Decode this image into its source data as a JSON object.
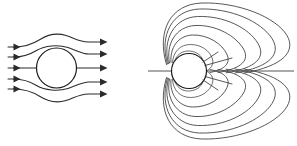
{
  "figure": {
    "background_color": "#ffffff",
    "width": 297,
    "height": 146,
    "panels": [
      {
        "id": "left-panel",
        "name": "streamline-flow-diagram",
        "description": "Uniform flow deflected around a circular body, five streamlines with arrowheads at both ends",
        "line_color": "#2b2b2b",
        "body": {
          "shape": "circle",
          "cx": 56.5,
          "cy": 68,
          "r": 20
        },
        "streamline_count": 5,
        "arrow_count_left": 5,
        "arrow_count_right": 5,
        "flow_direction": "left-to-right",
        "streamlines": [
          {
            "y_inlet": 47,
            "y_outlet": 42,
            "offset": -2
          },
          {
            "y_inlet": 57,
            "y_outlet": 54,
            "offset": -1
          },
          {
            "y_inlet": 68,
            "y_outlet": 68,
            "offset": 0
          },
          {
            "y_inlet": 79,
            "y_outlet": 82,
            "offset": 1
          },
          {
            "y_inlet": 89,
            "y_outlet": 94,
            "offset": 2
          }
        ],
        "inlet_x": 12,
        "outlet_x": 104
      },
      {
        "id": "right-panel",
        "name": "dipole-field-diagram",
        "description": "Magnetic dipole field with nested closed loops above and below, stretched toward the right, horizontal neutral line through the centre",
        "line_color": "#3a3a3a",
        "axis_color": "#555555",
        "body": {
          "shape": "circle",
          "cx": 189,
          "cy": 71,
          "r": 17.5
        },
        "loop_count_per_side": 7,
        "sides": [
          "upper",
          "lower"
        ],
        "axis": {
          "y": 71,
          "x_start": 148,
          "x_end": 294
        },
        "loops_upper": [
          {
            "index": 1,
            "apex_x": 196,
            "apex_y": 50,
            "extent_x": 205
          },
          {
            "index": 2,
            "apex_x": 199,
            "apex_y": 42,
            "extent_x": 215
          },
          {
            "index": 3,
            "apex_x": 202,
            "apex_y": 33,
            "extent_x": 231
          },
          {
            "index": 4,
            "apex_x": 205,
            "apex_y": 25,
            "extent_x": 248
          },
          {
            "index": 5,
            "apex_x": 208,
            "apex_y": 17,
            "extent_x": 263
          },
          {
            "index": 6,
            "apex_x": 211,
            "apex_y": 10,
            "extent_x": 278
          },
          {
            "index": 7,
            "apex_x": 214,
            "apex_y": 5,
            "extent_x": 291
          }
        ],
        "loops_lower": [
          {
            "index": 1,
            "apex_x": 196,
            "apex_y": 92,
            "extent_x": 205
          },
          {
            "index": 2,
            "apex_x": 199,
            "apex_y": 100,
            "extent_x": 215
          },
          {
            "index": 3,
            "apex_x": 202,
            "apex_y": 109,
            "extent_x": 231
          },
          {
            "index": 4,
            "apex_x": 205,
            "apex_y": 117,
            "extent_x": 248
          },
          {
            "index": 5,
            "apex_x": 208,
            "apex_y": 125,
            "extent_x": 263
          },
          {
            "index": 6,
            "apex_x": 211,
            "apex_y": 132,
            "extent_x": 278
          },
          {
            "index": 7,
            "apex_x": 214,
            "apex_y": 138,
            "extent_x": 291
          }
        ]
      }
    ]
  }
}
